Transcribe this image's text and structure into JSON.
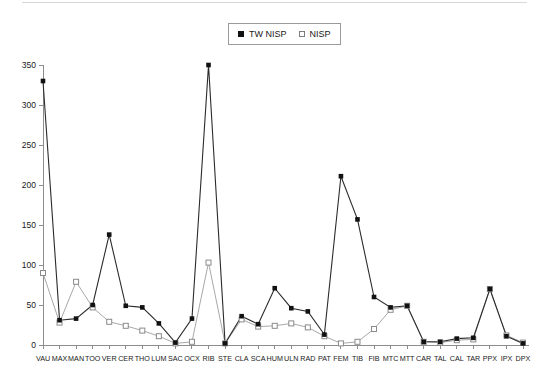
{
  "legend": {
    "position": "top-center",
    "entries": [
      {
        "label": "TW NISP",
        "marker": "filled-square",
        "color": "#111111"
      },
      {
        "label": "NISP",
        "marker": "open-square",
        "color": "#a8a8a8"
      }
    ]
  },
  "chart_data": {
    "type": "line",
    "title": "",
    "subtitle": "",
    "xlabel": "",
    "ylabel": "",
    "ylim": [
      0,
      350
    ],
    "yticks": [
      0,
      50,
      100,
      150,
      200,
      250,
      300,
      350
    ],
    "grid": false,
    "legend_position": "top-center",
    "categories": [
      "VAU",
      "MAX",
      "MAN",
      "TOO",
      "VER",
      "CER",
      "THO",
      "LUM",
      "SAC",
      "OCX",
      "RIB",
      "STE",
      "CLA",
      "SCA",
      "HUM",
      "ULN",
      "RAD",
      "PAT",
      "FEM",
      "TIB",
      "FIB",
      "MTC",
      "MTT",
      "CAR",
      "TAL",
      "CAL",
      "TAR",
      "PPX",
      "IPX",
      "DPX"
    ],
    "series": [
      {
        "name": "TW NISP",
        "marker": "filled-square",
        "color": "#111111",
        "values": [
          330,
          31,
          33,
          50,
          138,
          49,
          47,
          27,
          3,
          33,
          350,
          2,
          36,
          26,
          71,
          46,
          42,
          13,
          211,
          157,
          60,
          47,
          49,
          4,
          4,
          8,
          9,
          70,
          11,
          2
        ]
      },
      {
        "name": "NISP",
        "marker": "open-square",
        "color": "#a8a8a8",
        "values": [
          90,
          28,
          79,
          47,
          29,
          24,
          18,
          11,
          2,
          4,
          103,
          2,
          32,
          23,
          24,
          27,
          22,
          11,
          2,
          4,
          20,
          44,
          49,
          4,
          3,
          6,
          7,
          70,
          12,
          3
        ]
      }
    ]
  },
  "axes": {
    "y_tick_labels": [
      "0",
      "50",
      "100",
      "150",
      "200",
      "250",
      "300",
      "350"
    ],
    "x_tick_labels": [
      "VAU",
      "MAX",
      "MAN",
      "TOO",
      "VER",
      "CER",
      "THO",
      "LUM",
      "SAC",
      "OCX",
      "RIB",
      "STE",
      "CLA",
      "SCA",
      "HUM",
      "ULN",
      "RAD",
      "PAT",
      "FEM",
      "TIB",
      "FIB",
      "MTC",
      "MTT",
      "CAR",
      "TAL",
      "CAL",
      "TAR",
      "PPX",
      "IPX",
      "DPX"
    ]
  },
  "geometry": {
    "plot_left": 43,
    "plot_right": 523,
    "plot_top": 65,
    "plot_bottom": 345,
    "y_max": 350
  }
}
